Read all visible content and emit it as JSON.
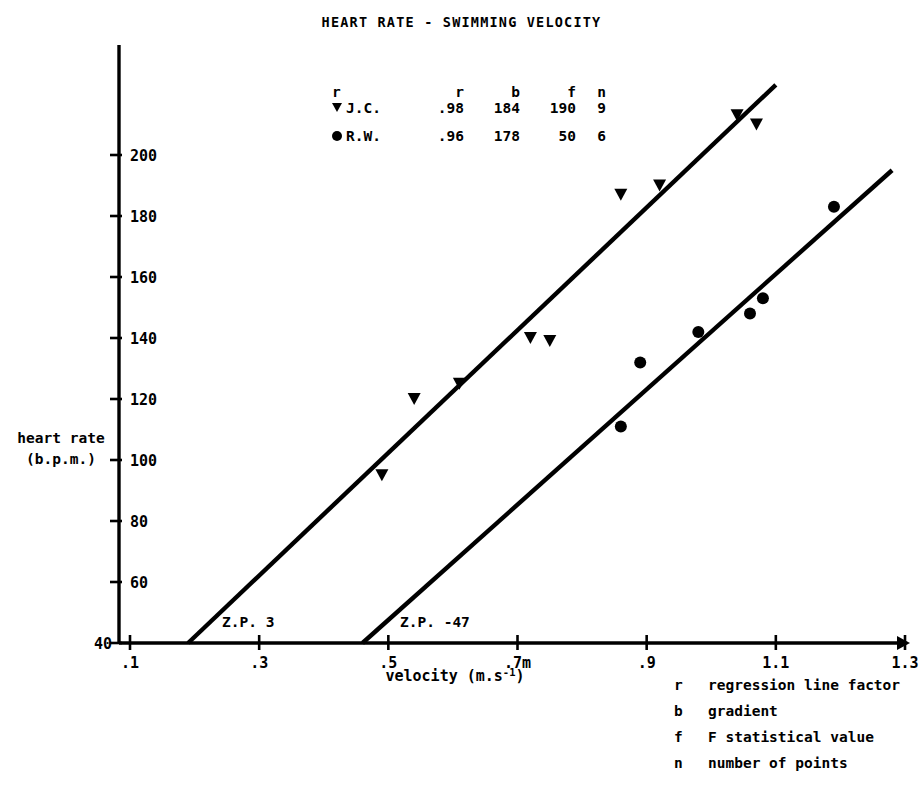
{
  "chart_title": "HEART RATE - SWIMMING VELOCITY",
  "axes": {
    "y_label_line1": "heart rate",
    "y_label_line2": "(b.p.m.)",
    "x_label_main": "velocity (m.s",
    "x_label_sup": "-1",
    "x_label_tail": ")",
    "y_ticks": [
      "40",
      "60",
      "80",
      "100",
      "120",
      "140",
      "160",
      "180",
      "200"
    ],
    "x_ticks": [
      ".1",
      ".3",
      ".5",
      ".7m",
      ".9",
      "1.1",
      "1.3"
    ]
  },
  "legend": {
    "headers": {
      "marker": "r",
      "r": "r",
      "b": "b",
      "f": "f",
      "n": "n"
    },
    "rows": [
      {
        "marker": "triangle",
        "name": "J.C.",
        "r": ".98",
        "b": "184",
        "f": "190",
        "n": "9"
      },
      {
        "marker": "circle",
        "name": "R.W.",
        "r": ".96",
        "b": "178",
        "f": "50",
        "n": "6"
      }
    ]
  },
  "annotations": {
    "zp_jc": "Z.P. 3",
    "zp_rw": "Z.P. -47"
  },
  "footnote": [
    {
      "key": "r",
      "text": "regression line factor"
    },
    {
      "key": "b",
      "text": "gradient"
    },
    {
      "key": "f",
      "text": "F statistical value"
    },
    {
      "key": "n",
      "text": "number of points"
    }
  ],
  "colors": {
    "ink": "#000000",
    "background": "#ffffff"
  },
  "chart_data": {
    "type": "scatter",
    "title": "HEART RATE - SWIMMING VELOCITY",
    "xlabel": "velocity (m.s^-1)",
    "ylabel": "heart rate (b.p.m.)",
    "xlim": [
      0.1,
      1.3
    ],
    "ylim": [
      40,
      215
    ],
    "grid": false,
    "legend_position": "upper-center-left",
    "series": [
      {
        "name": "J.C.",
        "marker": "triangle-down",
        "r": 0.98,
        "b": 184,
        "f": 190,
        "n": 9,
        "zero_point": 3,
        "points": [
          {
            "x": 0.49,
            "y": 95
          },
          {
            "x": 0.54,
            "y": 120
          },
          {
            "x": 0.61,
            "y": 125
          },
          {
            "x": 0.72,
            "y": 140
          },
          {
            "x": 0.75,
            "y": 139
          },
          {
            "x": 0.86,
            "y": 187
          },
          {
            "x": 0.92,
            "y": 190
          },
          {
            "x": 1.04,
            "y": 213
          },
          {
            "x": 1.07,
            "y": 210
          }
        ],
        "fit_line": {
          "x1": 0.19,
          "y1": 40,
          "x2": 1.1,
          "y2": 223
        }
      },
      {
        "name": "R.W.",
        "marker": "circle",
        "r": 0.96,
        "b": 178,
        "f": 50,
        "n": 6,
        "zero_point": -47,
        "points": [
          {
            "x": 0.86,
            "y": 111
          },
          {
            "x": 0.89,
            "y": 132
          },
          {
            "x": 0.98,
            "y": 142
          },
          {
            "x": 1.06,
            "y": 148
          },
          {
            "x": 1.08,
            "y": 153
          },
          {
            "x": 1.19,
            "y": 183
          }
        ],
        "fit_line": {
          "x1": 0.46,
          "y1": 40,
          "x2": 1.28,
          "y2": 195
        }
      }
    ]
  }
}
